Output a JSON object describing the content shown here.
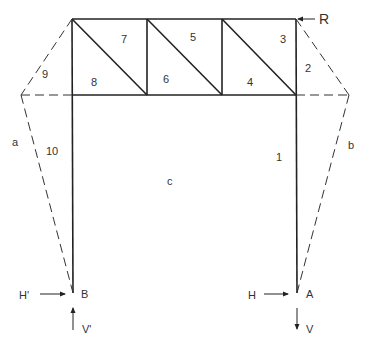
{
  "diagram": {
    "colors": {
      "line": "#222222",
      "text": "#333333",
      "background": "#ffffff"
    },
    "nodes": {
      "top_left": [
        72,
        19
      ],
      "top_p1": [
        147,
        19
      ],
      "top_p2": [
        222,
        19
      ],
      "top_right": [
        296,
        19
      ],
      "bot_left": [
        72,
        95
      ],
      "bot_p1": [
        147,
        95
      ],
      "bot_p2": [
        222,
        95
      ],
      "bot_right": [
        296,
        95
      ],
      "support_B": [
        73,
        293
      ],
      "support_A": [
        297,
        293
      ],
      "dash_left_apex": [
        21,
        95
      ],
      "dash_right_apex": [
        349,
        95
      ]
    },
    "member_labels": [
      {
        "id": "1",
        "text": "1",
        "x": 276,
        "y": 161
      },
      {
        "id": "2",
        "text": "2",
        "x": 305,
        "y": 72
      },
      {
        "id": "3",
        "text": "3",
        "x": 280,
        "y": 43
      },
      {
        "id": "4",
        "text": "4",
        "x": 247,
        "y": 86
      },
      {
        "id": "5",
        "text": "5",
        "x": 190,
        "y": 41
      },
      {
        "id": "6",
        "text": "6",
        "x": 163,
        "y": 83
      },
      {
        "id": "7",
        "text": "7",
        "x": 121,
        "y": 43
      },
      {
        "id": "8",
        "text": "8",
        "x": 91,
        "y": 86
      },
      {
        "id": "9",
        "text": "9",
        "x": 42,
        "y": 78
      },
      {
        "id": "10",
        "text": "10",
        "x": 46,
        "y": 155
      }
    ],
    "region_labels": [
      {
        "id": "a",
        "text": "a",
        "x": 12,
        "y": 146
      },
      {
        "id": "b",
        "text": "b",
        "x": 348,
        "y": 149
      },
      {
        "id": "c",
        "text": "c",
        "x": 167,
        "y": 185
      }
    ],
    "support_labels": {
      "B": {
        "text": "B",
        "x": 81,
        "y": 298
      },
      "A": {
        "text": "A",
        "x": 306,
        "y": 298
      }
    },
    "forces": {
      "R": {
        "text": "R",
        "x": 319,
        "y": 24
      },
      "H_prime": {
        "text": "H'",
        "x": 19,
        "y": 299
      },
      "V_prime": {
        "text": "V'",
        "x": 82,
        "y": 333
      },
      "H": {
        "text": "H",
        "x": 248,
        "y": 299
      },
      "V": {
        "text": "V",
        "x": 306,
        "y": 333
      }
    }
  }
}
